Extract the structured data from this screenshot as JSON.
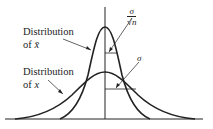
{
  "labels": {
    "sample_mean_dist_line1": "Distribution",
    "sample_mean_dist_line2_prefix": "of ",
    "sample_mean_var": "x̄",
    "population_dist_line1": "Distribution",
    "population_dist_line2_prefix": "of ",
    "population_var": "x",
    "std_error_numerator": "σ",
    "std_error_denominator_root": "√",
    "std_error_denominator_var": "n",
    "std_dev": "σ"
  },
  "curves": {
    "sample_mean": {
      "description": "narrow tall normal curve",
      "peak_y": 27,
      "left_tail_x": 60,
      "right_tail_x": 150
    },
    "population": {
      "description": "wide low normal curve",
      "peak_y": 72,
      "left_tail_x": 15,
      "right_tail_x": 195
    }
  },
  "axis": {
    "center_x": 105,
    "baseline_y": 119
  },
  "colors": {
    "stroke": "#222222",
    "background": "#ffffff"
  }
}
